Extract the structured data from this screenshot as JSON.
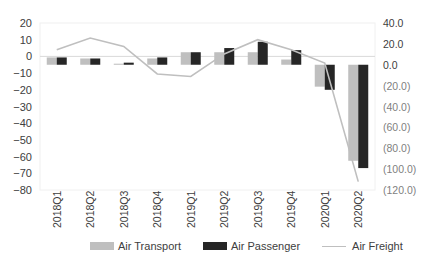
{
  "chart_data": {
    "type": "bar+line",
    "title": "",
    "categories": [
      "2018Q1",
      "2018Q2",
      "2018Q3",
      "2018Q4",
      "2019Q1",
      "2019Q2",
      "2019Q3",
      "2019Q4",
      "2020Q1",
      "2020Q2"
    ],
    "series": [
      {
        "name": "Air Transport",
        "type": "bar",
        "axis": "right",
        "color": "#bfbfbf",
        "values": [
          7,
          6,
          1,
          6,
          12,
          12,
          12,
          5,
          -21,
          -92
        ]
      },
      {
        "name": "Air Passenger",
        "type": "bar",
        "axis": "right",
        "color": "#262626",
        "values": [
          7,
          6,
          2,
          7,
          12,
          16,
          22,
          14,
          -24,
          -99
        ]
      },
      {
        "name": "Air Freight",
        "type": "line",
        "axis": "left",
        "color": "#bfbfbf",
        "values": [
          4,
          11,
          6,
          -10.5,
          -12,
          1.5,
          10,
          4,
          -4,
          -75
        ]
      }
    ],
    "left_axis": {
      "ticks": [
        "20",
        "10",
        "0",
        "−10",
        "−20",
        "−30",
        "−40",
        "−50",
        "−60",
        "−70",
        "−80"
      ],
      "min": -80,
      "max": 20,
      "step": 10
    },
    "right_axis": {
      "ticks": [
        "40.0",
        "20.0",
        "0.0",
        "(20.0)",
        "(40.0)",
        "(60.0)",
        "(80.0)",
        "(100.0)",
        "(120.0)"
      ],
      "min": -120,
      "max": 40,
      "step": 20
    },
    "xlabel": "",
    "ylabel": "",
    "grid": "zero-line only",
    "legend_position": "bottom"
  },
  "legend": {
    "items": [
      {
        "label": "Air Transport",
        "kind": "bar",
        "color": "#bfbfbf"
      },
      {
        "label": "Air Passenger",
        "kind": "bar",
        "color": "#262626"
      },
      {
        "label": "Air Freight",
        "kind": "line",
        "color": "#bfbfbf"
      }
    ]
  }
}
